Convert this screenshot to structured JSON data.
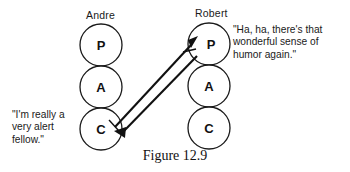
{
  "figure": {
    "caption": "Figure 12.9",
    "type": "transactional-analysis-pac-diagram",
    "stroke_color": "#1a1a1a",
    "fill_color": "#ffffff",
    "background": "#ffffff"
  },
  "people": [
    {
      "id": "andre",
      "name": "Andre",
      "ego_states": [
        {
          "code": "P",
          "name": "parent"
        },
        {
          "code": "A",
          "name": "adult"
        },
        {
          "code": "C",
          "name": "child"
        }
      ]
    },
    {
      "id": "robert",
      "name": "Robert",
      "ego_states": [
        {
          "code": "P",
          "name": "parent"
        },
        {
          "code": "A",
          "name": "adult"
        },
        {
          "code": "C",
          "name": "child"
        }
      ]
    }
  ],
  "speech": {
    "left": "\"I'm really a\nvery alert\nfellow.\"",
    "right": "\"Ha, ha, there's that\nwonderful sense of\nhumor again.\""
  },
  "transactions": [
    {
      "id": "stimulus",
      "from": "andre.C",
      "to": "robert.P",
      "direction": "up-right"
    },
    {
      "id": "response",
      "from": "robert.P",
      "to": "andre.C",
      "direction": "down-left"
    }
  ]
}
